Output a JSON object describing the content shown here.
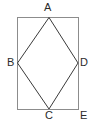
{
  "figure": {
    "name": "rhombus-inscribed-in-rectangle",
    "background_color": "#ffffff",
    "rectangle": {
      "name": "outer-rectangle",
      "stroke_color": "#8c8c8c",
      "stroke_width": 1,
      "fill": "none",
      "x": 17,
      "y": 17,
      "width": 61,
      "height": 92
    },
    "rhombus": {
      "name": "inner-rhombus",
      "stroke_color": "#3a3a3a",
      "stroke_width": 1,
      "fill": "none",
      "points": "49,17 78,63 49,109 17,63"
    },
    "vertices": [
      {
        "id": "A",
        "label": "A",
        "x": 49,
        "y": 17,
        "on": "rectangle-top-edge"
      },
      {
        "id": "B",
        "label": "B",
        "x": 17,
        "y": 63,
        "on": "rectangle-left-edge"
      },
      {
        "id": "C",
        "label": "C",
        "x": 49,
        "y": 109,
        "on": "rectangle-bottom-edge"
      },
      {
        "id": "D",
        "label": "D",
        "x": 78,
        "y": 63,
        "on": "rectangle-right-edge"
      },
      {
        "id": "E",
        "label": "E",
        "x": 78,
        "y": 109,
        "on": "rectangle-bottom-right-corner"
      }
    ],
    "labels": {
      "A": "A",
      "B": "B",
      "C": "C",
      "D": "D",
      "E": "E"
    }
  }
}
